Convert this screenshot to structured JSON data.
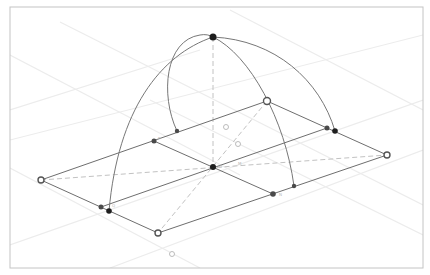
{
  "diagram": {
    "title": "",
    "type": "3d-geometry-construction",
    "frame": {
      "x": 10,
      "y": 7,
      "width": 413,
      "height": 261,
      "stroke": "#c4c4c4"
    },
    "colors": {
      "background": "#ffffff",
      "grid": "#ececec",
      "edge": "#6e6e6e",
      "arc": "#777777",
      "dashed": "#c2c2c2",
      "point_dark": "#1e1e1e",
      "point_mid": "#4a4a4a",
      "point_open": "#8a8a8a"
    },
    "grid_lines": [
      {
        "x1": 10,
        "y1": 55,
        "x2": 240,
        "y2": 175
      },
      {
        "x1": 60,
        "y1": 22,
        "x2": 423,
        "y2": 205
      },
      {
        "x1": 230,
        "y1": 10,
        "x2": 423,
        "y2": 110
      },
      {
        "x1": 10,
        "y1": 110,
        "x2": 200,
        "y2": 50
      },
      {
        "x1": 10,
        "y1": 245,
        "x2": 423,
        "y2": 100
      },
      {
        "x1": 110,
        "y1": 268,
        "x2": 423,
        "y2": 150
      },
      {
        "x1": 10,
        "y1": 168,
        "x2": 200,
        "y2": 268
      },
      {
        "x1": 150,
        "y1": 100,
        "x2": 423,
        "y2": 235
      },
      {
        "x1": 10,
        "y1": 140,
        "x2": 423,
        "y2": 35
      }
    ],
    "polygon": {
      "label": "rhombus",
      "vertices": [
        {
          "name": "left-vertex",
          "x": 41,
          "y": 180
        },
        {
          "name": "top-vertex",
          "x": 267,
          "y": 101
        },
        {
          "name": "right-vertex",
          "x": 387,
          "y": 155
        },
        {
          "name": "bottom-vertex",
          "x": 158,
          "y": 233
        }
      ]
    },
    "inner_lines": [
      {
        "name": "midline-a",
        "x1": 154,
        "y1": 141,
        "x2": 273,
        "y2": 194
      },
      {
        "name": "midline-b",
        "x1": 101,
        "y1": 207,
        "x2": 327,
        "y2": 128
      }
    ],
    "dashed_lines": [
      {
        "name": "diagonal-horizontal",
        "x1": 41,
        "y1": 180,
        "x2": 387,
        "y2": 155
      },
      {
        "name": "diagonal-vertical",
        "x1": 267,
        "y1": 101,
        "x2": 158,
        "y2": 233
      },
      {
        "name": "vertical-axis",
        "x1": 213,
        "y1": 37,
        "x2": 213,
        "y2": 167
      }
    ],
    "arcs": [
      {
        "name": "arc-left-outer",
        "d": "M 109 211 C 118 110, 160 55, 213 37"
      },
      {
        "name": "arc-right-outer",
        "d": "M 213 37 C 275 40, 320 80, 335 131"
      },
      {
        "name": "arc-left-inner",
        "d": "M 177 131 C 160 95, 165 40, 200 35 C 205 34, 210 35, 213 37"
      },
      {
        "name": "arc-right-inner",
        "d": "M 213 37 C 250 55, 285 120, 294 186"
      }
    ],
    "points": [
      {
        "name": "apex-point",
        "x": 213,
        "y": 37,
        "r": 3.5,
        "style": "dark"
      },
      {
        "name": "center-point",
        "x": 213,
        "y": 167,
        "r": 3,
        "style": "dark",
        "label": "O"
      },
      {
        "name": "left-vertex-point",
        "x": 41,
        "y": 180,
        "r": 3,
        "style": "open"
      },
      {
        "name": "top-vertex-point",
        "x": 267,
        "y": 101,
        "r": 3.5,
        "style": "open"
      },
      {
        "name": "right-vertex-point",
        "x": 387,
        "y": 155,
        "r": 3,
        "style": "open"
      },
      {
        "name": "bottom-vertex-point",
        "x": 158,
        "y": 233,
        "r": 3,
        "style": "open"
      },
      {
        "name": "midpoint-top-left",
        "x": 154,
        "y": 141,
        "r": 2.5,
        "style": "mid"
      },
      {
        "name": "arc-foot-top-left",
        "x": 177,
        "y": 131,
        "r": 2.2,
        "style": "mid"
      },
      {
        "name": "midpoint-bottom-left",
        "x": 101,
        "y": 207,
        "r": 2.5,
        "style": "mid"
      },
      {
        "name": "arc-foot-bottom-left",
        "x": 109,
        "y": 211,
        "r": 2.8,
        "style": "dark"
      },
      {
        "name": "midpoint-top-right",
        "x": 327,
        "y": 128,
        "r": 2.5,
        "style": "mid"
      },
      {
        "name": "arc-foot-top-right",
        "x": 335,
        "y": 131,
        "r": 2.8,
        "style": "dark"
      },
      {
        "name": "midpoint-bottom-right",
        "x": 273,
        "y": 194,
        "r": 2.8,
        "style": "mid"
      },
      {
        "name": "arc-foot-bottom-right",
        "x": 294,
        "y": 186,
        "r": 2.2,
        "style": "mid"
      },
      {
        "name": "free-point-1",
        "x": 226,
        "y": 127,
        "r": 2.5,
        "style": "ghost"
      },
      {
        "name": "free-point-2",
        "x": 238,
        "y": 144,
        "r": 2.5,
        "style": "ghost"
      },
      {
        "name": "free-point-3",
        "x": 172,
        "y": 254,
        "r": 2.5,
        "style": "ghost"
      }
    ],
    "labels": [
      {
        "name": "label-center",
        "x": 219,
        "y": 168,
        "text": "O"
      },
      {
        "name": "label-center-right",
        "x": 238,
        "y": 165,
        "text": "M"
      },
      {
        "name": "label-bottom-right",
        "x": 279,
        "y": 196,
        "text": "N"
      },
      {
        "name": "label-top-left",
        "x": 158,
        "y": 140,
        "text": "P"
      },
      {
        "name": "label-bottom-left",
        "x": 112,
        "y": 207,
        "text": "Q"
      }
    ]
  }
}
